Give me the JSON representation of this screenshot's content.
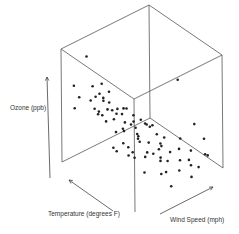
{
  "chart_data": {
    "type": "scatter",
    "projection": "3d",
    "title": "",
    "axes": {
      "x": {
        "label": "Temperature (degrees F)",
        "range": [
          56,
          97
        ]
      },
      "y": {
        "label": "Wind Speed (mph)",
        "range": [
          1.7,
          20.7
        ]
      },
      "z": {
        "label": "Ozone (ppb)",
        "range": [
          1,
          168
        ]
      }
    },
    "grid": false,
    "box": true,
    "tick_labels": false,
    "point_color": "#222222",
    "points": [
      {
        "temp": 90,
        "wind": 4.5,
        "ozone": 160
      },
      {
        "temp": 92,
        "wind": 2.5,
        "ozone": 120
      },
      {
        "temp": 88,
        "wind": 5.0,
        "ozone": 118
      },
      {
        "temp": 86,
        "wind": 6.2,
        "ozone": 121
      },
      {
        "temp": 84,
        "wind": 7.0,
        "ozone": 110
      },
      {
        "temp": 93,
        "wind": 4.0,
        "ozone": 96
      },
      {
        "temp": 89,
        "wind": 6.0,
        "ozone": 97
      },
      {
        "temp": 87,
        "wind": 6.9,
        "ozone": 96
      },
      {
        "temp": 85,
        "wind": 7.4,
        "ozone": 91
      },
      {
        "temp": 91,
        "wind": 5.7,
        "ozone": 89
      },
      {
        "temp": 82,
        "wind": 8.0,
        "ozone": 85
      },
      {
        "temp": 80,
        "wind": 9.2,
        "ozone": 85
      },
      {
        "temp": 94,
        "wind": 3.4,
        "ozone": 80
      },
      {
        "temp": 86,
        "wind": 7.4,
        "ozone": 79
      },
      {
        "temp": 83,
        "wind": 9.7,
        "ozone": 78
      },
      {
        "temp": 81,
        "wind": 8.6,
        "ozone": 77
      },
      {
        "temp": 88,
        "wind": 6.3,
        "ozone": 76
      },
      {
        "temp": 79,
        "wind": 10.3,
        "ozone": 73
      },
      {
        "temp": 92,
        "wind": 6.9,
        "ozone": 71
      },
      {
        "temp": 84,
        "wind": 8.0,
        "ozone": 66
      },
      {
        "temp": 78,
        "wind": 11.5,
        "ozone": 64
      },
      {
        "temp": 87,
        "wind": 9.7,
        "ozone": 63
      },
      {
        "temp": 76,
        "wind": 12.0,
        "ozone": 59
      },
      {
        "temp": 82,
        "wind": 10.9,
        "ozone": 52
      },
      {
        "temp": 90,
        "wind": 8.6,
        "ozone": 50
      },
      {
        "temp": 77,
        "wind": 10.3,
        "ozone": 49
      },
      {
        "temp": 81,
        "wind": 11.5,
        "ozone": 47
      },
      {
        "temp": 85,
        "wind": 12.6,
        "ozone": 45
      },
      {
        "temp": 74,
        "wind": 9.7,
        "ozone": 45
      },
      {
        "temp": 79,
        "wind": 13.8,
        "ozone": 44
      },
      {
        "temp": 72,
        "wind": 7.4,
        "ozone": 41
      },
      {
        "temp": 83,
        "wind": 14.3,
        "ozone": 40
      },
      {
        "temp": 76,
        "wind": 8.0,
        "ozone": 39
      },
      {
        "temp": 80,
        "wind": 6.3,
        "ozone": 37
      },
      {
        "temp": 68,
        "wind": 10.3,
        "ozone": 36
      },
      {
        "temp": 86,
        "wind": 10.9,
        "ozone": 35
      },
      {
        "temp": 75,
        "wind": 12.0,
        "ozone": 34
      },
      {
        "temp": 71,
        "wind": 13.2,
        "ozone": 32
      },
      {
        "temp": 78,
        "wind": 14.9,
        "ozone": 31
      },
      {
        "temp": 82,
        "wind": 9.2,
        "ozone": 30
      },
      {
        "temp": 67,
        "wind": 11.5,
        "ozone": 28
      },
      {
        "temp": 73,
        "wind": 10.9,
        "ozone": 27
      },
      {
        "temp": 77,
        "wind": 16.1,
        "ozone": 24
      },
      {
        "temp": 69,
        "wind": 14.3,
        "ozone": 23
      },
      {
        "temp": 66,
        "wind": 12.6,
        "ozone": 21
      },
      {
        "temp": 74,
        "wind": 13.8,
        "ozone": 20
      },
      {
        "temp": 62,
        "wind": 9.7,
        "ozone": 19
      },
      {
        "temp": 70,
        "wind": 16.6,
        "ozone": 18
      },
      {
        "temp": 65,
        "wind": 14.9,
        "ozone": 16
      },
      {
        "temp": 61,
        "wind": 13.2,
        "ozone": 14
      },
      {
        "temp": 68,
        "wind": 18.4,
        "ozone": 13
      },
      {
        "temp": 64,
        "wind": 11.5,
        "ozone": 12
      },
      {
        "temp": 59,
        "wind": 16.6,
        "ozone": 11
      },
      {
        "temp": 63,
        "wind": 20.1,
        "ozone": 9
      },
      {
        "temp": 57,
        "wind": 14.3,
        "ozone": 8
      },
      {
        "temp": 72,
        "wind": 20.7,
        "ozone": 37
      },
      {
        "temp": 65,
        "wind": 20.1,
        "ozone": 30
      },
      {
        "temp": 78,
        "wind": 19.5,
        "ozone": 96
      },
      {
        "temp": 60,
        "wind": 18.4,
        "ozone": 22
      },
      {
        "temp": 58,
        "wind": 10.3,
        "ozone": 6
      },
      {
        "temp": 84,
        "wind": 4.6,
        "ozone": 85
      },
      {
        "temp": 89,
        "wind": 7.4,
        "ozone": 65
      },
      {
        "temp": 80,
        "wind": 6.9,
        "ozone": 58
      },
      {
        "temp": 75,
        "wind": 5.1,
        "ozone": 45
      },
      {
        "temp": 73,
        "wind": 6.9,
        "ozone": 36
      },
      {
        "temp": 81,
        "wind": 12.0,
        "ozone": 29
      },
      {
        "temp": 71,
        "wind": 9.7,
        "ozone": 28
      },
      {
        "temp": 76,
        "wind": 14.9,
        "ozone": 21
      },
      {
        "temp": 79,
        "wind": 8.0,
        "ozone": 61
      },
      {
        "temp": 87,
        "wind": 11.5,
        "ozone": 44
      },
      {
        "temp": 91,
        "wind": 10.3,
        "ozone": 59
      },
      {
        "temp": 93,
        "wind": 9.2,
        "ozone": 73
      },
      {
        "temp": 67,
        "wind": 8.0,
        "ozone": 18
      },
      {
        "temp": 70,
        "wind": 12.6,
        "ozone": 14
      },
      {
        "temp": 62,
        "wind": 16.1,
        "ozone": 10
      },
      {
        "temp": 77,
        "wind": 9.7,
        "ozone": 16
      },
      {
        "temp": 84,
        "wind": 13.2,
        "ozone": 23
      },
      {
        "temp": 74,
        "wind": 18.4,
        "ozone": 20
      },
      {
        "temp": 66,
        "wind": 17.2,
        "ozone": 7
      },
      {
        "temp": 82,
        "wind": 15.5,
        "ozone": 35
      },
      {
        "temp": 86,
        "wind": 5.7,
        "ozone": 108
      }
    ]
  }
}
